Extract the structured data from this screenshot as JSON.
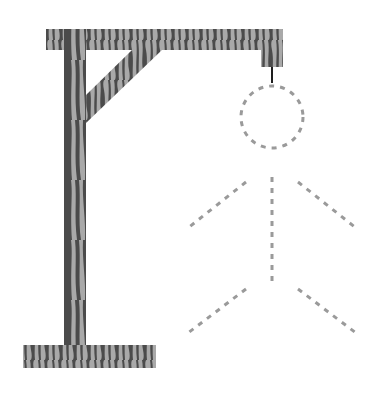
{
  "game": {
    "name": "hangman",
    "parts_revealed": [
      "gallows",
      "rope"
    ],
    "parts_hidden_outline": [
      "head",
      "body",
      "left-arm",
      "right-arm",
      "left-leg",
      "right-leg"
    ]
  },
  "colors": {
    "background": "#ffffff",
    "wood_dark": "#4b4b4b",
    "wood_light": "#a9a9a9",
    "rope": "#1e1e1e",
    "figure_dash": "#9a9a9a"
  }
}
